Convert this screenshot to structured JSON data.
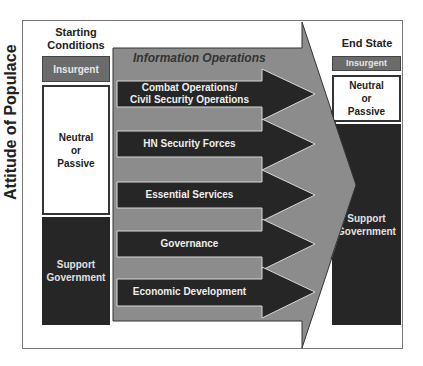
{
  "diagram": {
    "vertical_axis_label": "Attitude of Populace",
    "starting": {
      "header_line1": "Starting",
      "header_line2": "Conditions",
      "insurgent": "Insurgent",
      "neutral": [
        "Neutral",
        "or",
        "Passive"
      ],
      "support": [
        "Support",
        "Government"
      ]
    },
    "end": {
      "header": "End State",
      "insurgent": "Insurgent",
      "neutral": [
        "Neutral",
        "or",
        "Passive"
      ],
      "support": [
        "Support",
        "Government"
      ]
    },
    "big_arrow_label": "Information Operations",
    "lines_of_effort": [
      {
        "line1": "Combat Operations/",
        "line2": "Civil Security Operations"
      },
      {
        "line1": "HN Security Forces",
        "line2": ""
      },
      {
        "line1": "Essential Services",
        "line2": ""
      },
      {
        "line1": "Governance",
        "line2": ""
      },
      {
        "line1": "Economic Development",
        "line2": ""
      }
    ],
    "colors": {
      "insurgent": "#6b6b6b",
      "support": "#262626",
      "big_arrow": "#8c8c8c",
      "small_arrow": "#262626"
    }
  }
}
